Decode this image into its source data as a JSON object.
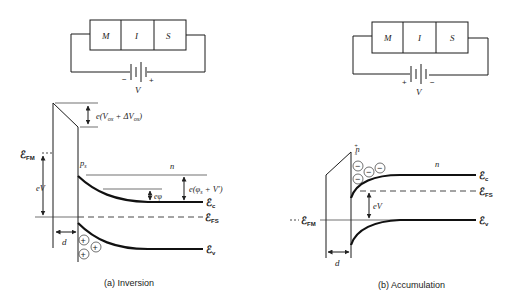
{
  "panels": [
    {
      "id": "a",
      "caption": "(a)  Inversion",
      "device": {
        "layers": [
          "M",
          "I",
          "S"
        ],
        "battery_label": "V",
        "polarity_left": "−",
        "polarity_right": "+"
      },
      "labels": {
        "oxide_drop": "e(V",
        "oxide_drop_sub1": "ox",
        "oxide_drop_mid": " + ΔV",
        "oxide_drop_sub2": "ox",
        "oxide_drop_end": ")",
        "fermi_metal": "ℰ",
        "fermi_metal_sub": "FM",
        "applied": "eV",
        "surface_carrier": "p",
        "surface_carrier_sub": "s",
        "bulk_type": "n",
        "ephi": "eφ",
        "surface_potential": "e(φ",
        "surface_potential_sub": "s",
        "surface_potential_end": " + V′)",
        "conduction": "ℰ",
        "conduction_sub": "c",
        "fermi_semi": "ℰ",
        "fermi_semi_sub": "FS",
        "valence": "ℰ",
        "valence_sub": "v",
        "thickness": "d",
        "charge_symbol": "+"
      }
    },
    {
      "id": "b",
      "caption": "(b)  Accumulation",
      "device": {
        "layers": [
          "M",
          "I",
          "S"
        ],
        "battery_label": "V",
        "polarity_left": "+",
        "polarity_right": "−"
      },
      "labels": {
        "surface_carrier": "n",
        "surface_carrier_sub": "s",
        "surface_carrier_sup": "+",
        "bulk_type": "n",
        "conduction": "ℰ",
        "conduction_sub": "c",
        "fermi_semi": "ℰ",
        "fermi_semi_sub": "FS",
        "applied": "eV",
        "fermi_metal": "ℰ",
        "fermi_metal_sub": "FM",
        "valence": "ℰ",
        "valence_sub": "v",
        "thickness": "d",
        "charge_symbol": "−"
      }
    }
  ]
}
